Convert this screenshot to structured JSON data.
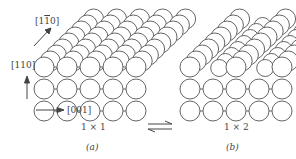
{
  "figure": {
    "panels": [
      {
        "id": "a",
        "caption": "(a)",
        "structure_label": "1 × 1",
        "description": "Unreconstructed surface: top layer complete"
      },
      {
        "id": "b",
        "caption": "(b)",
        "structure_label": "1 × 2",
        "description": "Missing-row reconstructed surface: alternate top rows removed"
      }
    ],
    "axes": {
      "in_plane": {
        "prefix": "[1",
        "bar_digit": "1",
        "suffix": "0]"
      },
      "normal": "[110]",
      "along_row": "[001]"
    },
    "equilibrium_symbol": "⇌",
    "colors": {
      "atom_stroke": "#555555",
      "atom_fill": "#ffffff",
      "bond": "#555555",
      "text": "#444444",
      "background": "#ffffff"
    }
  }
}
